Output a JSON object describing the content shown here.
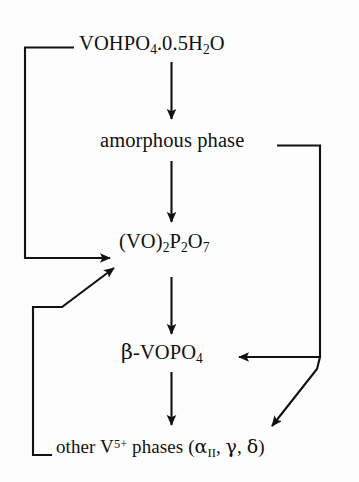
{
  "diagram": {
    "background_color": "#fdfdfd",
    "line_color": "#111111",
    "text_color": "#111111",
    "nodes": [
      {
        "id": "precursor",
        "label": "VOHPO4.0.5H2O",
        "parts": [
          {
            "t": "VOHPO",
            "k": "base"
          },
          {
            "t": "4",
            "k": "sub"
          },
          {
            "t": ".0.5H",
            "k": "base"
          },
          {
            "t": "2",
            "k": "sub"
          },
          {
            "t": "O",
            "k": "base"
          }
        ]
      },
      {
        "id": "amorphous",
        "label": "amorphous phase",
        "parts": [
          {
            "t": "amorphous phase",
            "k": "base"
          }
        ]
      },
      {
        "id": "pyro",
        "label": "(VO)2P2O7",
        "parts": [
          {
            "t": "(VO)",
            "k": "base"
          },
          {
            "t": "2",
            "k": "sub"
          },
          {
            "t": "P",
            "k": "base"
          },
          {
            "t": "2",
            "k": "sub"
          },
          {
            "t": "O",
            "k": "base"
          },
          {
            "t": "7",
            "k": "sub"
          }
        ]
      },
      {
        "id": "beta",
        "label": "β-VOPO4",
        "parts": [
          {
            "t": "β",
            "k": "greek"
          },
          {
            "t": "-VOPO",
            "k": "base"
          },
          {
            "t": "4",
            "k": "sub"
          }
        ]
      },
      {
        "id": "other",
        "label": "other V5+ phases (αII, γ, δ)",
        "parts": [
          {
            "t": "other V",
            "k": "base"
          },
          {
            "t": "5+",
            "k": "sup"
          },
          {
            "t": " phases (",
            "k": "base"
          },
          {
            "t": "α",
            "k": "greek"
          },
          {
            "t": "II",
            "k": "sub"
          },
          {
            "t": ", ",
            "k": "base"
          },
          {
            "t": "γ",
            "k": "greek"
          },
          {
            "t": ", ",
            "k": "base"
          },
          {
            "t": "δ",
            "k": "greek"
          },
          {
            "t": ")",
            "k": "base"
          }
        ]
      }
    ],
    "edges": [
      {
        "id": "precursor-to-amorphous",
        "from": "precursor",
        "to": "amorphous",
        "style": "straight-down-arrow"
      },
      {
        "id": "amorphous-to-pyro",
        "from": "amorphous",
        "to": "pyro",
        "style": "straight-down-arrow"
      },
      {
        "id": "pyro-to-beta",
        "from": "pyro",
        "to": "beta",
        "style": "straight-down-arrow"
      },
      {
        "id": "beta-to-other",
        "from": "beta",
        "to": "other",
        "style": "straight-down-arrow"
      },
      {
        "id": "precursor-to-pyro-left-rail",
        "from": "precursor",
        "to": "pyro",
        "style": "left-elbow-arrow"
      },
      {
        "id": "other-to-pyro-left-rail",
        "from": "other",
        "to": "pyro",
        "style": "left-elbow-diagonal-arrow"
      },
      {
        "id": "amorphous-to-beta-right-rail",
        "from": "amorphous",
        "to": "beta",
        "style": "right-elbow-arrow"
      },
      {
        "id": "amorphous-to-other-right-rail",
        "from": "amorphous",
        "to": "other",
        "style": "right-rail-diagonal-arrow"
      }
    ]
  }
}
